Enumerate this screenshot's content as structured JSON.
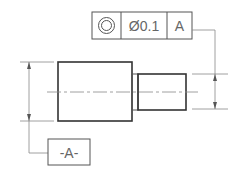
{
  "drawing": {
    "title": "Concentricity tolerance callout",
    "feature_control_frame": {
      "symbol": "concentricity-icon",
      "tolerance": "Ø0.1",
      "datum_reference": "A"
    },
    "datum_feature": {
      "label": "-A-"
    }
  }
}
